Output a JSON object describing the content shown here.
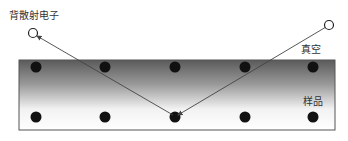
{
  "diagram": {
    "labels": {
      "backscattered_electron": "背散射电子",
      "vacuum": "真空",
      "sample": "样品"
    },
    "colors": {
      "sample_top": "#5f5f5f",
      "sample_bottom": "#ffffff",
      "atom": "#111111",
      "line": "#444444"
    },
    "atom_rows": 2,
    "atom_columns": 5
  }
}
